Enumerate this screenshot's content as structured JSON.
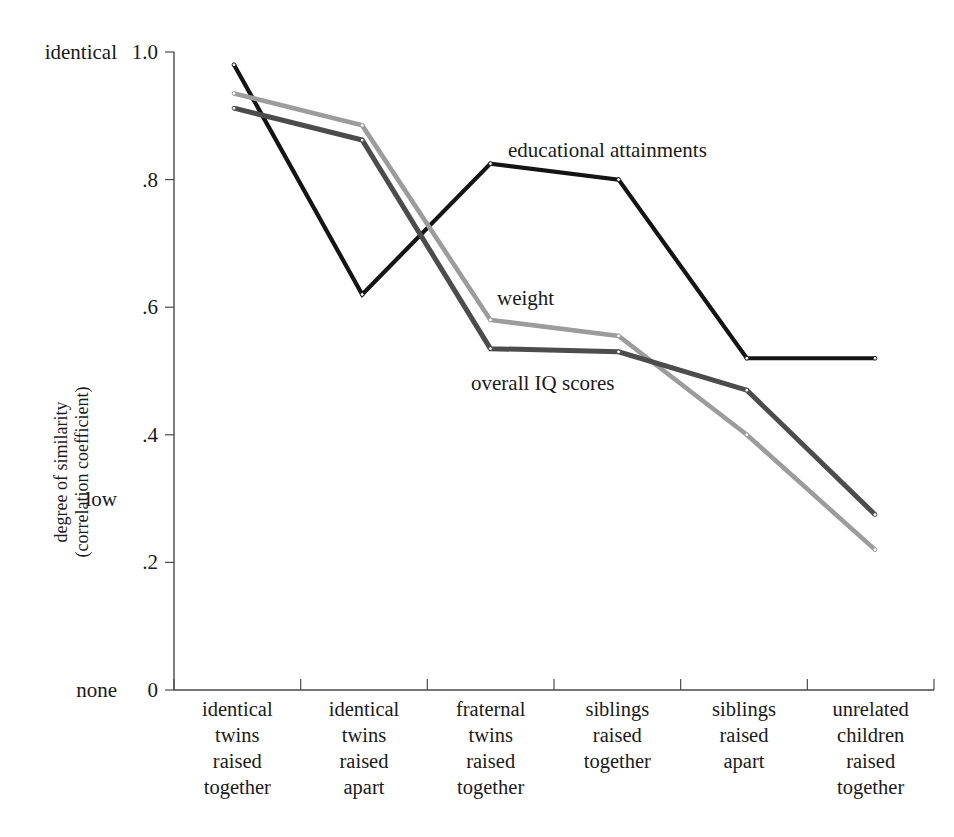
{
  "chart_data": {
    "type": "line",
    "title": "",
    "xlabel": "",
    "ylabel": "degree of similarity",
    "ylabel_line2": "(correlation coefficient)",
    "ylim": [
      0,
      1.0
    ],
    "grid": false,
    "legend_position": "inline-annotations",
    "categories": [
      "identical twins raised together",
      "identical twins raised apart",
      "fraternal twins raised together",
      "siblings raised together",
      "siblings raised apart",
      "unrelated children raised together"
    ],
    "category_lines": [
      [
        "identical",
        "twins",
        "raised",
        "together"
      ],
      [
        "identical",
        "twins",
        "raised",
        "apart"
      ],
      [
        "fraternal",
        "twins",
        "raised",
        "together"
      ],
      [
        "siblings",
        "raised",
        "together"
      ],
      [
        "siblings",
        "raised",
        "apart"
      ],
      [
        "unrelated",
        "children",
        "raised",
        "together"
      ]
    ],
    "y_ticks": [
      0,
      0.2,
      0.4,
      0.6,
      0.8,
      1.0
    ],
    "y_tick_labels": [
      "0",
      ".2",
      ".4",
      ".6",
      ".8",
      "1.0"
    ],
    "y_anchor_labels": [
      {
        "text": "identical",
        "value": 1.0
      },
      {
        "text": "low",
        "value": 0.3
      },
      {
        "text": "none",
        "value": 0.0
      }
    ],
    "series": [
      {
        "name": "educational attainments",
        "color": "#141414",
        "width": 4.2,
        "values": [
          0.98,
          0.62,
          0.825,
          0.8,
          0.52,
          0.52
        ],
        "annotation": "educational attainments"
      },
      {
        "name": "weight",
        "color": "#9c9c9c",
        "width": 4.6,
        "values": [
          0.935,
          0.885,
          0.58,
          0.555,
          0.4,
          0.22
        ],
        "annotation": "weight"
      },
      {
        "name": "overall IQ scores",
        "color": "#4c4c4c",
        "width": 5.0,
        "values": [
          0.912,
          0.862,
          0.535,
          0.53,
          0.47,
          0.275
        ],
        "annotation": "overall IQ scores"
      }
    ],
    "annotations": [
      {
        "text": "educational attainments",
        "x": 508,
        "y": 157
      },
      {
        "text": "weight",
        "x": 497,
        "y": 305
      },
      {
        "text": "overall IQ scores",
        "x": 471,
        "y": 390
      }
    ]
  },
  "geometry": {
    "plot_left": 174,
    "plot_right": 934,
    "plot_top": 52,
    "plot_bottom": 690,
    "first_point_x": 234,
    "last_point_x": 875
  }
}
